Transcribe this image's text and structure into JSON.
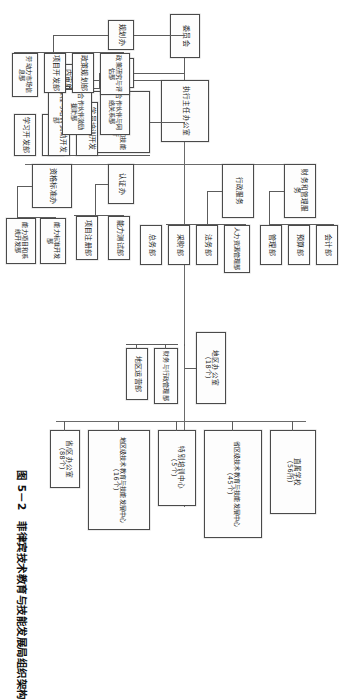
{
  "figure": {
    "caption_number": "图 5－2",
    "caption_title": "菲律宾技术教育与技能发展局组织架构",
    "caption_full": "图 5－2　菲律宾技术教育与技能发展局组织架构"
  },
  "colors": {
    "box_border": "#4a4a4a",
    "line": "#5c5c5c",
    "box_fill": "#fdfdfd",
    "text": "#1a1a1a",
    "background": "#ffffff"
  },
  "org": {
    "board": {
      "label": "委员会"
    },
    "internal_audit": {
      "label": "内审单位"
    },
    "executive_office": {
      "label": "执行主任办公室"
    },
    "branches": [
      {
        "key": "finance_admin_services",
        "label": "财务和管理服务",
        "children": [
          {
            "label": "会计部"
          },
          {
            "label": "预算部"
          },
          {
            "label": "管理部"
          }
        ]
      },
      {
        "key": "administrative_services",
        "label": "行政服务",
        "children": [
          {
            "label": "人力资源管理部"
          },
          {
            "label": "法务部"
          },
          {
            "label": "采购部"
          },
          {
            "label": "总务部"
          }
        ]
      },
      {
        "key": "certification_office",
        "label": "认证办",
        "children": [
          {
            "label": "能力测试部"
          },
          {
            "label": "项目注册部"
          }
        ]
      },
      {
        "key": "qualification_standards_office",
        "label": "资格标准办",
        "children": [
          {
            "label": "能力标准开发部"
          },
          {
            "label": "能力项目和系统开发部"
          }
        ]
      },
      {
        "key": "national_institute",
        "label": "全国技术教育和技能发展研究所",
        "children": [
          {
            "label": "技术研发部"
          },
          {
            "label": "学习开发部"
          },
          {
            "label": "学员培训开发部"
          },
          {
            "label": "课程与培训资助开发部"
          }
        ]
      },
      {
        "key": "external_liaison_office",
        "label": "外联办",
        "children": [
          {
            "label": "合作伙伴与网络关系部"
          },
          {
            "label": "合作伙伴激励援助部"
          }
        ]
      },
      {
        "key": "planning_office",
        "label": "规划办",
        "children": [
          {
            "label": "政策研究与评估部"
          },
          {
            "label": "政策规划部"
          },
          {
            "label": "项目开发部"
          },
          {
            "label": "劳动力市场信息部"
          }
        ]
      }
    ],
    "regional": {
      "office": {
        "label": "地区办公室",
        "count": "（18个）"
      },
      "units": [
        {
          "label": "财务与行政管理部"
        },
        {
          "label": "地区运营部"
        }
      ],
      "facilities": [
        {
          "label": "省/区办公室",
          "count": "（88个）"
        },
        {
          "label": "地区级技术教育与技能发展中心",
          "count": "（16个）"
        },
        {
          "label": "特别培训中心",
          "count": "（5个）"
        },
        {
          "label": "省区级技术教育与技能发展中心",
          "count": "（45个）"
        },
        {
          "label": "直属学校",
          "count": "（56所）"
        }
      ]
    }
  }
}
